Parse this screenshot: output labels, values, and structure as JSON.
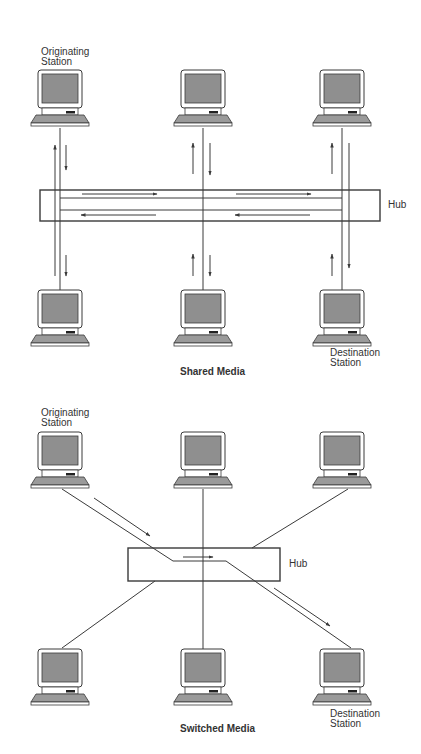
{
  "diagrams": [
    {
      "id": "shared",
      "caption": "Shared Media",
      "hub_label": "Hub",
      "originating_label_line1": "Originating",
      "originating_label_line2": "Station",
      "destination_label_line1": "Destination",
      "destination_label_line2": "Station"
    },
    {
      "id": "switched",
      "caption": "Switched Media",
      "hub_label": "Hub",
      "originating_label_line1": "Originating",
      "originating_label_line2": "Station",
      "destination_label_line1": "Destination",
      "destination_label_line2": "Station"
    }
  ],
  "icons": {
    "station": "computer-icon",
    "hub": "hub-box"
  },
  "colors": {
    "line": "#3a3a3a",
    "screen": "#8f8f8f",
    "frame": "#ffffff",
    "background": "#ffffff"
  }
}
